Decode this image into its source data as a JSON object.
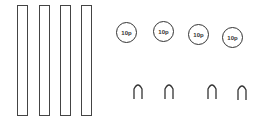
{
  "diagram": {
    "bars": [
      {
        "x": 17
      },
      {
        "x": 39
      },
      {
        "x": 60
      },
      {
        "x": 81
      }
    ],
    "coins": [
      {
        "label": "10p",
        "cx": 127,
        "cy": 33
      },
      {
        "label": "10p",
        "cx": 164,
        "cy": 32
      },
      {
        "label": "10p",
        "cx": 199,
        "cy": 35
      },
      {
        "label": "10p",
        "cx": 233,
        "cy": 38
      }
    ],
    "arches": [
      {
        "x": 133
      },
      {
        "x": 164
      },
      {
        "x": 207
      },
      {
        "x": 237
      }
    ],
    "colors": {
      "stroke": "#333333",
      "background": "#ffffff"
    }
  }
}
